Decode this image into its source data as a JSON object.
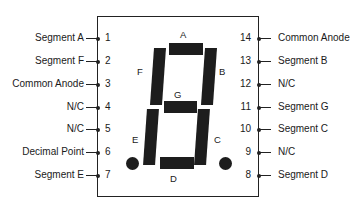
{
  "diagram": {
    "title": "",
    "component": "7-segment display pinout",
    "left_pins": [
      {
        "number": "1",
        "label": "Segment A"
      },
      {
        "number": "2",
        "label": "Segment F"
      },
      {
        "number": "3",
        "label": "Common Anode"
      },
      {
        "number": "4",
        "label": "N/C"
      },
      {
        "number": "5",
        "label": "N/C"
      },
      {
        "number": "6",
        "label": "Decimal Point"
      },
      {
        "number": "7",
        "label": "Segment E"
      }
    ],
    "right_pins": [
      {
        "number": "14",
        "label": "Common Anode"
      },
      {
        "number": "13",
        "label": "Segment B"
      },
      {
        "number": "12",
        "label": "N/C"
      },
      {
        "number": "11",
        "label": "Segment G"
      },
      {
        "number": "10",
        "label": "Segment C"
      },
      {
        "number": "9",
        "label": "N/C"
      },
      {
        "number": "8",
        "label": "Segment D"
      }
    ],
    "segments": {
      "a": "A",
      "b": "B",
      "c": "C",
      "d": "D",
      "e": "E",
      "f": "F",
      "g": "G"
    },
    "colors": {
      "ink": "#1d1d1d",
      "background": "#ffffff"
    }
  }
}
